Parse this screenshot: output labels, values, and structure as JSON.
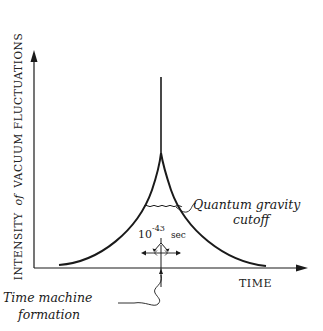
{
  "diagram": {
    "axes": {
      "y_label_prefix": "INTENSITY",
      "y_label_of": "of",
      "y_label_suffix": "VACUUM FLUCTUATIONS",
      "x_label": "TIME"
    },
    "annotations": {
      "cutoff_line1": "Quantum gravity",
      "cutoff_line2": "cutoff",
      "interval_base": "10",
      "interval_exponent": "-43",
      "interval_unit": "sec",
      "event_line1": "Time machine",
      "event_line2": "formation"
    },
    "colors": {
      "ink": "#1a1a1a",
      "background": "#ffffff"
    }
  }
}
